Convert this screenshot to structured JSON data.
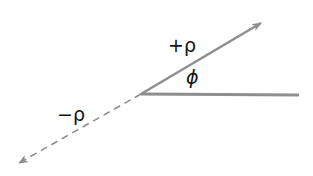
{
  "diagram": {
    "labels": {
      "positive": "+ρ",
      "negative": "−ρ",
      "angle": "ϕ"
    },
    "colors": {
      "line": "#8e8e8e",
      "text": "#111111",
      "background": "#ffffff"
    },
    "geometry": {
      "origin": [
        141,
        94
      ],
      "horizontal_end": [
        299,
        95
      ],
      "positive_arrow_tip": [
        262,
        22
      ],
      "negative_arrow_tip": [
        18,
        164
      ]
    }
  }
}
